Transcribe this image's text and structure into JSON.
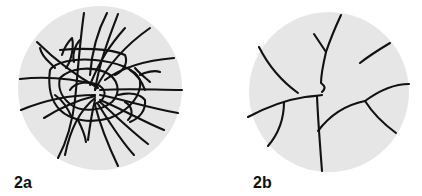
{
  "figure": {
    "panels": [
      {
        "id": "2a",
        "label": "2a",
        "description": "Densely branched, interwoven network of fibers within a circular field",
        "background_color": "#e6e6e6",
        "line_color": "#111111"
      },
      {
        "id": "2b",
        "label": "2b",
        "description": "Sparse, few branching fibers within a circular field",
        "background_color": "#e6e6e6",
        "line_color": "#111111"
      }
    ]
  }
}
